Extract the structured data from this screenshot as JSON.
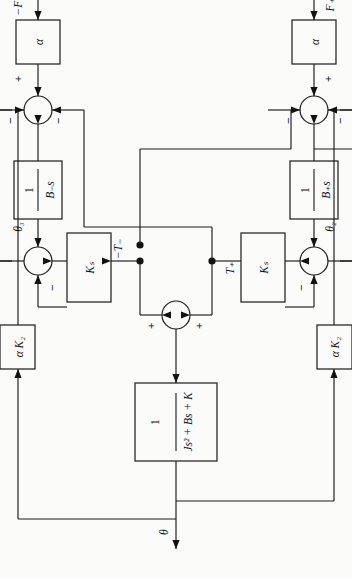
{
  "figure": {
    "kind": "control-system-block-diagram",
    "orientation": "rotated-90-ccw",
    "output_label": "θ",
    "blocks": {
      "plant_numerator": "1",
      "plant_denominator": "Js² + Bs + K",
      "gain_ks_left": "Kₛ",
      "gain_ks_right": "Kₛ",
      "gain_ak2_left": "α K₂",
      "gain_ak2_right": "α K₂",
      "integrator_left_num": "1",
      "integrator_left_den": "B₊s",
      "integrator_right_num": "1",
      "integrator_right_den": "B₋s",
      "alpha_left": "α",
      "alpha_right": "α"
    },
    "signals": {
      "input_left": "F₊",
      "input_right": "−F₋",
      "theta_left": "θ₂",
      "theta_right": "θ₃",
      "torque_left": "T₊",
      "torque_right": "−T₋",
      "output": "θ"
    },
    "signs": {
      "top_sum_left": "+",
      "top_sum_right": "+",
      "mid_sum_left": "−",
      "mid_sum_right": "−",
      "bottom_sum_left_in": "+",
      "bottom_sum_left_fb1": "−",
      "bottom_sum_left_fb2": "−",
      "bottom_sum_right_in": "+",
      "bottom_sum_right_fb1": "−",
      "bottom_sum_right_fb2": "−"
    },
    "colors": {
      "stroke": "#1a1a1a",
      "background": "#fbfbfa",
      "text": "#111111"
    }
  }
}
